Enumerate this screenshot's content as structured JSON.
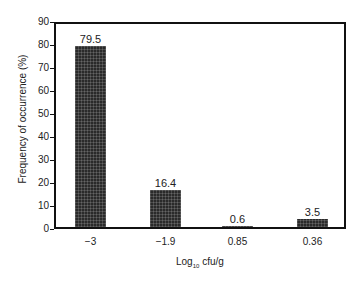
{
  "chart_data": {
    "type": "bar",
    "title": "",
    "categories": [
      "-3",
      "-1.9",
      "0.85",
      "0.36"
    ],
    "values": [
      79.5,
      16.4,
      0.6,
      3.5
    ],
    "data_labels": [
      "79.5",
      "16.4",
      "0.6",
      "3.5"
    ],
    "xlabel": "Log10 cfu/g",
    "ylabel": "Frequency of occurrence (%)",
    "ylim": [
      0,
      90
    ],
    "yticks": [
      0,
      10,
      20,
      30,
      40,
      50,
      60,
      70,
      80,
      90
    ],
    "grid": false,
    "legend": null
  },
  "axis": {
    "xlabel_main": "Log",
    "xlabel_sub": "10",
    "xlabel_tail": " cfu/g",
    "ylabel": "Frequency of occurrence (%)"
  },
  "colors": {
    "bar": "#2a2a2a",
    "axis": "#111111"
  }
}
